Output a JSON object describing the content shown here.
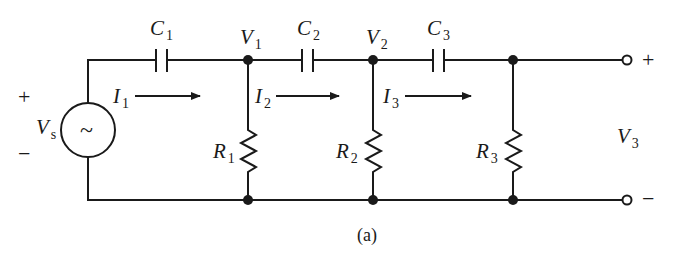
{
  "figure": {
    "caption": "(a)",
    "type": "three-stage RC ladder network"
  },
  "source": {
    "label": "V",
    "subscript": "s",
    "symbol": "~",
    "plus": "+",
    "minus": "−"
  },
  "capacitors": [
    {
      "label": "C",
      "subscript": "1"
    },
    {
      "label": "C",
      "subscript": "2"
    },
    {
      "label": "C",
      "subscript": "3"
    }
  ],
  "resistors": [
    {
      "label": "R",
      "subscript": "1"
    },
    {
      "label": "R",
      "subscript": "2"
    },
    {
      "label": "R",
      "subscript": "3"
    }
  ],
  "nodes": [
    {
      "label": "V",
      "subscript": "1"
    },
    {
      "label": "V",
      "subscript": "2"
    }
  ],
  "currents": [
    {
      "label": "I",
      "subscript": "1"
    },
    {
      "label": "I",
      "subscript": "2"
    },
    {
      "label": "I",
      "subscript": "3"
    }
  ],
  "output": {
    "label": "V",
    "subscript": "3",
    "plus": "+",
    "minus": "−"
  },
  "colors": {
    "ink": "#1a1a1a",
    "background": "#ffffff"
  }
}
